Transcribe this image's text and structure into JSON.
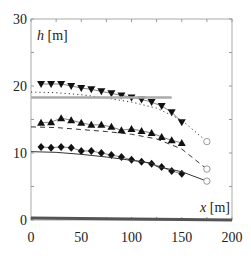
{
  "chart_data": {
    "type": "line",
    "title": "",
    "xlabel": "x [m]",
    "ylabel": "h [m]",
    "xlim": [
      0,
      200
    ],
    "ylim": [
      0,
      30
    ],
    "xticks": [
      0,
      50,
      100,
      150,
      200
    ],
    "yticks": [
      0,
      10,
      20,
      30
    ],
    "xtick_labels": [
      "0",
      "50",
      "100",
      "150",
      "200"
    ],
    "ytick_labels": [
      "0",
      "10",
      "20",
      "30"
    ],
    "grid": false,
    "legend": null,
    "series": [
      {
        "name": "measured-high",
        "style": "markers",
        "marker": "triangle-down",
        "connected": true,
        "x": [
          10,
          20,
          30,
          40,
          50,
          60,
          70,
          80,
          90,
          100,
          110,
          120,
          130,
          140,
          150
        ],
        "y": [
          20.3,
          20.3,
          20.3,
          20.0,
          19.7,
          19.5,
          19.2,
          18.9,
          18.6,
          18.3,
          18.0,
          17.6,
          17.0,
          16.1,
          14.6
        ]
      },
      {
        "name": "computed-high",
        "style": "dotted",
        "x": [
          0,
          25,
          50,
          75,
          100,
          125,
          150,
          175
        ],
        "y": [
          19.1,
          19.0,
          18.7,
          18.2,
          17.6,
          16.7,
          14.9,
          11.7
        ]
      },
      {
        "name": "measured-mid",
        "style": "markers",
        "marker": "triangle-up",
        "connected": true,
        "x": [
          10,
          20,
          30,
          40,
          50,
          60,
          70,
          80,
          90,
          100,
          110,
          120,
          130,
          140,
          150
        ],
        "y": [
          14.5,
          14.6,
          15.2,
          14.9,
          14.5,
          14.2,
          14.2,
          13.9,
          13.4,
          13.6,
          13.3,
          13.0,
          12.4,
          11.9,
          11.5
        ]
      },
      {
        "name": "computed-mid",
        "style": "dashed",
        "x": [
          0,
          25,
          50,
          75,
          100,
          125,
          150,
          175
        ],
        "y": [
          13.9,
          13.8,
          13.5,
          13.2,
          12.8,
          12.1,
          10.6,
          7.6
        ]
      },
      {
        "name": "measured-low",
        "style": "markers",
        "marker": "diamond",
        "connected": true,
        "x": [
          10,
          20,
          30,
          40,
          50,
          60,
          70,
          80,
          90,
          100,
          110,
          120,
          130,
          140,
          150
        ],
        "y": [
          10.9,
          10.8,
          10.9,
          10.8,
          10.3,
          10.3,
          10.0,
          9.7,
          9.4,
          9.0,
          8.7,
          8.4,
          7.9,
          7.3,
          6.9
        ]
      },
      {
        "name": "computed-low",
        "style": "solid",
        "x": [
          0,
          25,
          50,
          75,
          100,
          120,
          125,
          150,
          175
        ],
        "y": [
          10.2,
          10.1,
          9.8,
          9.4,
          8.9,
          8.5,
          8.0,
          7.2,
          5.8
        ]
      },
      {
        "name": "downstream-end",
        "style": "open-circles",
        "x": [
          175,
          175,
          175
        ],
        "y": [
          11.7,
          7.6,
          5.8
        ]
      },
      {
        "name": "reference-level",
        "style": "grey-solid-thick",
        "x": [
          0,
          140
        ],
        "y": [
          18.3,
          18.3
        ]
      },
      {
        "name": "bed",
        "style": "dark-solid-thick",
        "x": [
          0,
          200
        ],
        "y": [
          0.3,
          0.0
        ]
      }
    ]
  }
}
